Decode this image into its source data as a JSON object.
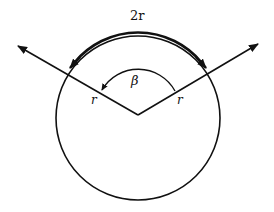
{
  "diagram": {
    "type": "geometry",
    "labels": {
      "arc_length": "2r",
      "angle": "β",
      "radius_left": "r",
      "radius_right": "r"
    },
    "colors": {
      "stroke": "#111111",
      "background": "#ffffff"
    }
  }
}
